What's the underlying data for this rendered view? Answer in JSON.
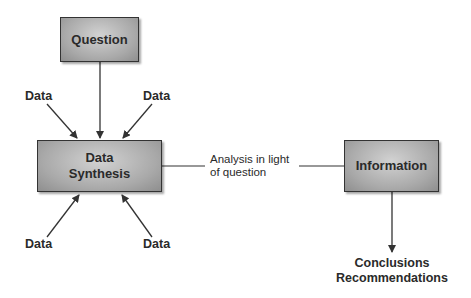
{
  "diagram": {
    "nodes": {
      "question": {
        "label": "Question"
      },
      "synthesis": {
        "line1": "Data",
        "line2": "Synthesis"
      },
      "information": {
        "label": "Information"
      }
    },
    "data_inputs": {
      "top_left": "Data",
      "top_right": "Data",
      "bottom_left": "Data",
      "bottom_right": "Data"
    },
    "edge_label": {
      "line1": "Analysis in light",
      "line2": "of question"
    },
    "output": {
      "line1": "Conclusions",
      "line2": "Recommendations"
    },
    "colors": {
      "box_fill": "#a9a9a9",
      "stroke": "#333333",
      "text": "#2a2a2a"
    }
  }
}
